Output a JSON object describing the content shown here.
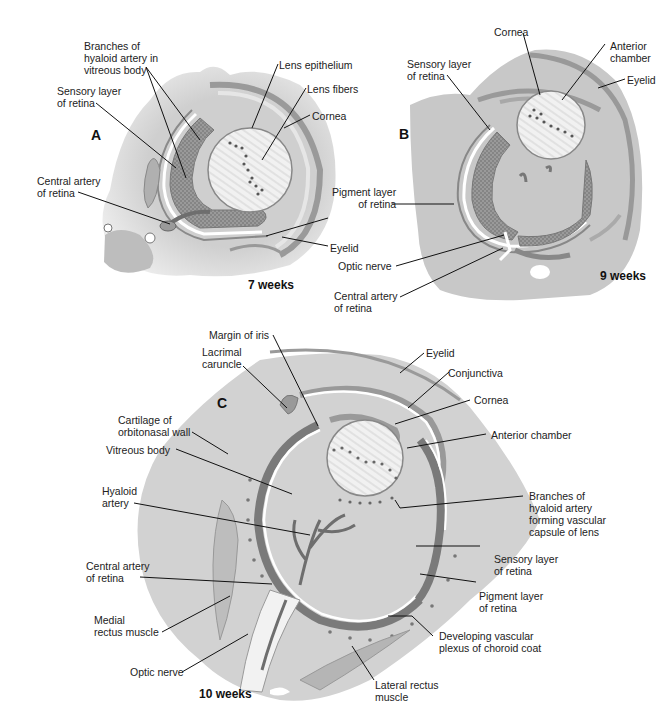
{
  "header": {
    "cropped_title": "Development of the eye (cropped)"
  },
  "panels": {
    "A": {
      "letter": "A",
      "age": "7 weeks",
      "labels": {
        "branches_hyaloid": "Branches of\nhyaloid artery in\nvitreous body",
        "sensory_layer": "Sensory layer\nof retina",
        "central_artery": "Central artery\nof retina",
        "lens_epithelium": "Lens epithelium",
        "lens_fibers": "Lens fibers",
        "cornea": "Cornea",
        "eyelid": "Eyelid"
      }
    },
    "shared": {
      "pigment_layer": "Pigment layer\nof retina"
    },
    "B": {
      "letter": "B",
      "age": "9 weeks",
      "labels": {
        "cornea": "Cornea",
        "anterior_chamber": "Anterior\nchamber",
        "eyelid": "Eyelid",
        "sensory_layer": "Sensory layer\nof retina",
        "optic_nerve": "Optic nerve",
        "central_artery": "Central artery\nof retina"
      }
    },
    "C": {
      "letter": "C",
      "age": "10 weeks",
      "labels": {
        "margin_iris": "Margin of iris",
        "lacrimal_caruncle": "Lacrimal\ncaruncle",
        "cartilage": "Cartilage of\norbitonasal wall",
        "vitreous_body": "Vitreous body",
        "hyaloid_artery": "Hyaloid\nartery",
        "central_artery": "Central artery\nof retina",
        "medial_rectus": "Medial\nrectus muscle",
        "optic_nerve": "Optic nerve",
        "eyelid": "Eyelid",
        "conjunctiva": "Conjunctiva",
        "cornea": "Cornea",
        "anterior_chamber": "Anterior chamber",
        "branches_capsule": "Branches of\nhyaloid artery\nforming vascular\ncapsule of lens",
        "sensory_layer": "Sensory layer\nof retina",
        "pigment_layer": "Pigment layer\nof retina",
        "choroid_plexus": "Developing vascular\nplexus of choroid coat",
        "lateral_rectus": "Lateral rectus\nmuscle"
      }
    }
  },
  "colors": {
    "tissue_light": "#d6d6d6",
    "tissue_mid": "#a9a9a9",
    "tissue_dark": "#777777",
    "retina_stipple": "#8a8a8a",
    "lens": "#eeeeee",
    "leader": "#111111"
  }
}
